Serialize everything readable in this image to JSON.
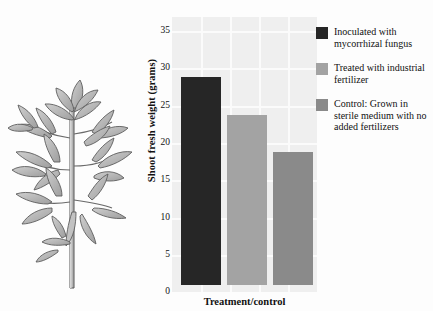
{
  "figure": {
    "background_color": "#fdfdfd",
    "illustration": {
      "name": "tomato-plant",
      "alt": "Line drawing of a tomato plant with compound leaves on an upright stem"
    }
  },
  "chart_data": {
    "type": "bar",
    "title": "",
    "xlabel": "Treatment/control",
    "ylabel": "Shoot fresh weight (grams)",
    "ylim": [
      0,
      35
    ],
    "ytick_labels": [
      "0",
      "5",
      "10",
      "15",
      "20",
      "25",
      "30",
      "35"
    ],
    "yticks": [
      0,
      5,
      10,
      15,
      20,
      25,
      30,
      35
    ],
    "grid": true,
    "grid_color": "#fbfbfb",
    "plot_background": "#efefef",
    "legend_position": "right",
    "categories": [
      "Inoculated with mycorrhizal fungus",
      "Treated with industrial fertilizer",
      "Control: Grown in sterile medium with no added fertilizers"
    ],
    "values": [
      27.2,
      22.2,
      17.4
    ],
    "colors": [
      "#262626",
      "#a3a3a3",
      "#8a8a8a"
    ]
  },
  "legend": {
    "entries": [
      {
        "label": "Inoculated with mycorrhizal fungus",
        "color": "#262626",
        "value": 27.2
      },
      {
        "label": "Treated with industrial fertilizer",
        "color": "#a3a3a3",
        "value": 22.2
      },
      {
        "label": "Control: Grown in sterile medium with no added fertilizers",
        "color": "#8a8a8a",
        "value": 17.4
      }
    ]
  }
}
